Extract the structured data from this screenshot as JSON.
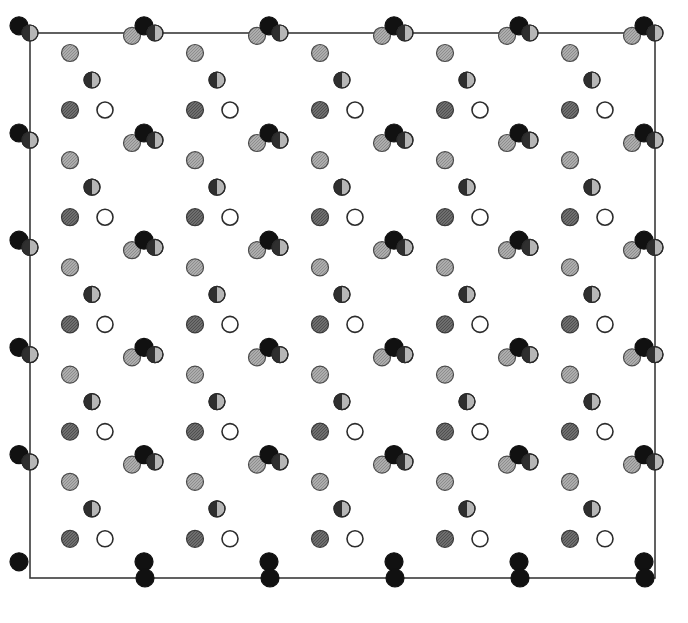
{
  "figure": {
    "background_color": "#ffffff",
    "frame": {
      "name": "unit-cell-outline",
      "x": 30,
      "y": 33,
      "width": 625,
      "height": 545,
      "stroke_color": "#3a3a3a",
      "stroke_width": 1.6,
      "fill": "#ffffff"
    },
    "lattice": {
      "period_x": 125,
      "period_y": 107.2,
      "origin_x": 20,
      "origin_y": 20,
      "columns": 6,
      "rows": 6
    },
    "atom_styles": [
      {
        "key": "light_gray",
        "label": "light grey atom",
        "fill": "#a8a8a8",
        "stroke": "#4a4a4a",
        "radius": 8.5,
        "pattern": "hatch"
      },
      {
        "key": "mid_gray",
        "label": "mid grey atom",
        "fill": "#6e6e6e",
        "stroke": "#3a3a3a",
        "radius": 8.5,
        "pattern": "hatch"
      },
      {
        "key": "dark_gray",
        "label": "dark grey atom",
        "fill": "#565656",
        "stroke": "#2c2c2c",
        "radius": 8.5,
        "pattern": "hatch"
      },
      {
        "key": "open",
        "label": "open (white) atom",
        "fill": "#ffffff",
        "stroke": "#2c2c2c",
        "radius": 8.0,
        "pattern": "none"
      },
      {
        "key": "black",
        "label": "filled black atom",
        "fill": "#111111",
        "stroke": "#111111",
        "radius": 9.0,
        "pattern": "none"
      },
      {
        "key": "split",
        "label": "half-shaded atom",
        "fill": "#8a8a8a",
        "stroke": "#2a2a2a",
        "radius": 8.0,
        "pattern": "half-left-dark"
      }
    ],
    "motif": [
      {
        "style": "split",
        "dx": 10,
        "dy": 13,
        "name": "atom-split-a"
      },
      {
        "style": "light_gray",
        "dx": 50,
        "dy": 33,
        "name": "atom-lightgray-a"
      },
      {
        "style": "split",
        "dx": 72,
        "dy": 60,
        "name": "atom-split-b"
      },
      {
        "style": "mid_gray",
        "dx": 50,
        "dy": 90,
        "name": "atom-midgray-a"
      },
      {
        "style": "open",
        "dx": 85,
        "dy": 90,
        "name": "atom-open-a"
      },
      {
        "style": "light_gray",
        "dx": 112,
        "dy": 123,
        "name": "atom-lightgray-b"
      },
      {
        "style": "black",
        "dx": 124,
        "dy": 113,
        "name": "atom-black-a"
      }
    ],
    "bottom_edge_atoms": {
      "style": "black",
      "y": 578,
      "x_positions": [
        145,
        270,
        395,
        520,
        645
      ],
      "name": "bottom-border-atom"
    }
  }
}
